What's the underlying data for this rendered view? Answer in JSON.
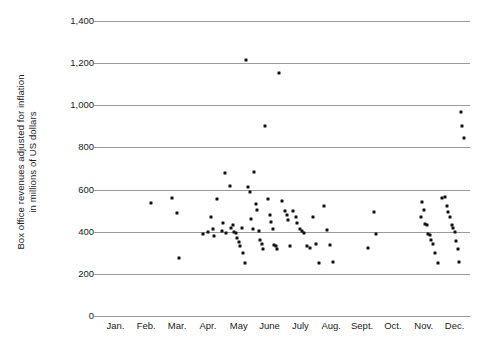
{
  "chart_data": {
    "type": "scatter",
    "title": "",
    "xlabel": "",
    "ylabel": "Box office revenues adjusted for inflation in millions of US dollars",
    "ylabel_lines": [
      "Box office revenues adjusted for inflation",
      "in millions of US dollars"
    ],
    "categories": [
      "Jan.",
      "Feb.",
      "Mar.",
      "Apr.",
      "May",
      "June",
      "July",
      "Aug.",
      "Sept.",
      "Oct.",
      "Nov.",
      "Dec."
    ],
    "ytick_labels": [
      "1,400",
      "1,200",
      "1,000",
      "800",
      "600",
      "400",
      "200",
      "0"
    ],
    "ytick_values": [
      1400,
      1200,
      1000,
      800,
      600,
      400,
      200,
      0
    ],
    "ylim": [
      0,
      1400
    ],
    "xlim": [
      0.5,
      12.5
    ],
    "grid": true,
    "legend": false,
    "marker": "square",
    "marker_color": "#111111",
    "gridline_color": "#9a9a9a",
    "background_color": "#ffffff",
    "points": [
      {
        "month": 2.15,
        "value": 535
      },
      {
        "month": 2.85,
        "value": 560
      },
      {
        "month": 3.0,
        "value": 490
      },
      {
        "month": 3.05,
        "value": 275
      },
      {
        "month": 3.85,
        "value": 390
      },
      {
        "month": 4.0,
        "value": 400
      },
      {
        "month": 4.1,
        "value": 470
      },
      {
        "month": 4.15,
        "value": 415
      },
      {
        "month": 4.2,
        "value": 380
      },
      {
        "month": 4.3,
        "value": 555
      },
      {
        "month": 4.45,
        "value": 405
      },
      {
        "month": 4.5,
        "value": 440
      },
      {
        "month": 4.55,
        "value": 680
      },
      {
        "month": 4.6,
        "value": 395
      },
      {
        "month": 4.7,
        "value": 615
      },
      {
        "month": 4.75,
        "value": 420
      },
      {
        "month": 4.8,
        "value": 430
      },
      {
        "month": 4.85,
        "value": 400
      },
      {
        "month": 4.9,
        "value": 395
      },
      {
        "month": 4.95,
        "value": 370
      },
      {
        "month": 5.0,
        "value": 350
      },
      {
        "month": 5.05,
        "value": 330
      },
      {
        "month": 5.1,
        "value": 420
      },
      {
        "month": 5.15,
        "value": 300
      },
      {
        "month": 5.2,
        "value": 250
      },
      {
        "month": 5.25,
        "value": 1215
      },
      {
        "month": 5.3,
        "value": 610
      },
      {
        "month": 5.35,
        "value": 590
      },
      {
        "month": 5.4,
        "value": 460
      },
      {
        "month": 5.45,
        "value": 415
      },
      {
        "month": 5.5,
        "value": 685
      },
      {
        "month": 5.55,
        "value": 530
      },
      {
        "month": 5.6,
        "value": 505
      },
      {
        "month": 5.65,
        "value": 405
      },
      {
        "month": 5.7,
        "value": 360
      },
      {
        "month": 5.75,
        "value": 340
      },
      {
        "month": 5.8,
        "value": 320
      },
      {
        "month": 5.85,
        "value": 900
      },
      {
        "month": 5.95,
        "value": 555
      },
      {
        "month": 6.0,
        "value": 480
      },
      {
        "month": 6.05,
        "value": 445
      },
      {
        "month": 6.1,
        "value": 415
      },
      {
        "month": 6.15,
        "value": 335
      },
      {
        "month": 6.2,
        "value": 330
      },
      {
        "month": 6.25,
        "value": 320
      },
      {
        "month": 6.3,
        "value": 1155
      },
      {
        "month": 6.4,
        "value": 545
      },
      {
        "month": 6.5,
        "value": 500
      },
      {
        "month": 6.55,
        "value": 480
      },
      {
        "month": 6.6,
        "value": 455
      },
      {
        "month": 6.65,
        "value": 330
      },
      {
        "month": 6.75,
        "value": 500
      },
      {
        "month": 6.85,
        "value": 470
      },
      {
        "month": 6.9,
        "value": 440
      },
      {
        "month": 7.0,
        "value": 415
      },
      {
        "month": 7.05,
        "value": 405
      },
      {
        "month": 7.1,
        "value": 395
      },
      {
        "month": 7.2,
        "value": 330
      },
      {
        "month": 7.3,
        "value": 325
      },
      {
        "month": 7.4,
        "value": 470
      },
      {
        "month": 7.5,
        "value": 340
      },
      {
        "month": 7.6,
        "value": 250
      },
      {
        "month": 7.75,
        "value": 520
      },
      {
        "month": 7.85,
        "value": 410
      },
      {
        "month": 7.95,
        "value": 335
      },
      {
        "month": 8.05,
        "value": 255
      },
      {
        "month": 9.4,
        "value": 495
      },
      {
        "month": 9.45,
        "value": 390
      },
      {
        "month": 9.2,
        "value": 325
      },
      {
        "month": 10.9,
        "value": 470
      },
      {
        "month": 10.95,
        "value": 540
      },
      {
        "month": 11.0,
        "value": 505
      },
      {
        "month": 11.05,
        "value": 435
      },
      {
        "month": 11.1,
        "value": 430
      },
      {
        "month": 11.15,
        "value": 390
      },
      {
        "month": 11.2,
        "value": 385
      },
      {
        "month": 11.25,
        "value": 360
      },
      {
        "month": 11.3,
        "value": 340
      },
      {
        "month": 11.35,
        "value": 300
      },
      {
        "month": 11.45,
        "value": 250
      },
      {
        "month": 11.6,
        "value": 560
      },
      {
        "month": 11.7,
        "value": 565
      },
      {
        "month": 11.75,
        "value": 520
      },
      {
        "month": 11.8,
        "value": 495
      },
      {
        "month": 11.85,
        "value": 470
      },
      {
        "month": 11.9,
        "value": 430
      },
      {
        "month": 11.95,
        "value": 420
      },
      {
        "month": 12.0,
        "value": 400
      },
      {
        "month": 12.05,
        "value": 355
      },
      {
        "month": 12.1,
        "value": 320
      },
      {
        "month": 12.15,
        "value": 255
      },
      {
        "month": 12.2,
        "value": 970
      },
      {
        "month": 12.25,
        "value": 900
      },
      {
        "month": 12.3,
        "value": 845
      }
    ]
  }
}
